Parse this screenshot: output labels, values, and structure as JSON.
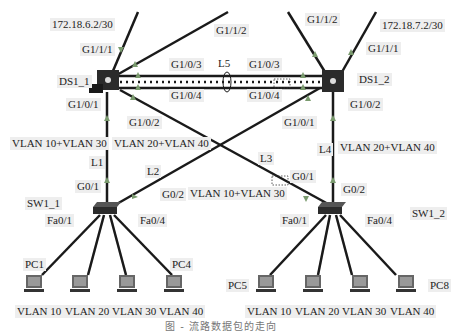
{
  "devices": {
    "ds1_1": {
      "name": "DS1_1"
    },
    "ds1_2": {
      "name": "DS1_2"
    },
    "sw1_1": {
      "name": "SW1_1"
    },
    "sw1_2": {
      "name": "SW1_2"
    },
    "pcs": [
      {
        "name": "PC1",
        "vlan": "VLAN 10"
      },
      {
        "name": "",
        "vlan": "VLAN 20"
      },
      {
        "name": "",
        "vlan": "VLAN 30"
      },
      {
        "name": "PC4",
        "vlan": "VLAN 40"
      },
      {
        "name": "PC5",
        "vlan": "VLAN 10"
      },
      {
        "name": "",
        "vlan": "VLAN 20"
      },
      {
        "name": "",
        "vlan": "VLAN 30"
      },
      {
        "name": "PC8",
        "vlan": "VLAN 40"
      }
    ]
  },
  "addresses": {
    "ds1_1_uplink": "172.18.6.2/30",
    "ds1_2_uplink": "172.18.7.2/30"
  },
  "ports": {
    "ds1_1_g111": "G1/1/1",
    "ds1_1_g112": "G1/1/2",
    "ds1_1_g103": "G1/0/3",
    "ds1_1_g104": "G1/0/4",
    "ds1_1_g101": "G1/0/1",
    "ds1_1_g102": "G1/0/2",
    "ds1_2_g112": "G1/1/2",
    "ds1_2_g111": "G1/1/1",
    "ds1_2_g103": "G1/0/3",
    "ds1_2_g104": "G1/0/4",
    "ds1_2_g102": "G1/0/2",
    "ds1_2_g101": "G1/0/1",
    "sw1_1_g01": "G0/1",
    "sw1_1_g02": "G0/2",
    "sw1_1_fa01": "Fa0/1",
    "sw1_1_fa04": "Fa0/4",
    "sw1_2_g01": "G0/1",
    "sw1_2_g02": "G0/2",
    "sw1_2_fa01": "Fa0/1",
    "sw1_2_fa04": "Fa0/4"
  },
  "links": {
    "l1": {
      "name": "L1",
      "vlans": "VLAN 10+VLAN 30"
    },
    "l2": {
      "name": "L2",
      "vlans": "VLAN 20+VLAN 40"
    },
    "l3": {
      "name": "L3",
      "vlans": "VLAN 10+VLAN 30"
    },
    "l4": {
      "name": "L4",
      "vlans": "VLAN 20+VLAN 40"
    },
    "l5": {
      "name": "L5"
    }
  },
  "colors": {
    "link": "#1a1a1a",
    "arrow": "#7a9a6e",
    "label_bg": "#eeeeee"
  },
  "caption": "图 - 流路数据包的走向"
}
